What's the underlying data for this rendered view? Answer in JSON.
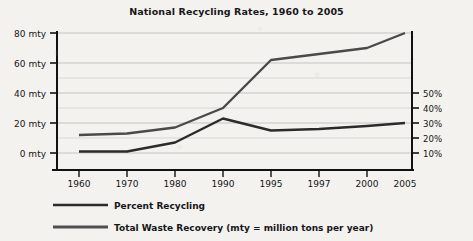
{
  "chart_data": {
    "type": "line",
    "title": "National Recycling Rates, 1960 to 2005",
    "xlabel": "",
    "ylabel": "",
    "grid": true,
    "legend_position": "bottom-left",
    "categories": [
      "1960",
      "1970",
      "1980",
      "1990",
      "1995",
      "1997",
      "2000",
      "2005"
    ],
    "left_axis": {
      "ticks": [
        "0 mty",
        "20 mty",
        "40 mty",
        "60 mty",
        "80 mty"
      ],
      "values": [
        0,
        20,
        40,
        60,
        80
      ],
      "unit": "mty",
      "ylim": [
        0,
        80
      ]
    },
    "right_axis": {
      "ticks": [
        "10%",
        "20%",
        "30%",
        "40%",
        "50%"
      ],
      "values": [
        10,
        20,
        30,
        40,
        50
      ],
      "unit": "%",
      "ylim": [
        0,
        100
      ]
    },
    "series": [
      {
        "name": "Percent Recycling",
        "axis": "right",
        "unit": "%",
        "values": [
          11,
          11,
          17,
          33,
          25,
          26,
          28,
          30
        ],
        "color": "#2b2b2b"
      },
      {
        "name": "Total Waste Recovery (mty = million tons per year)",
        "axis": "left",
        "unit": "mty",
        "values": [
          12,
          13,
          17,
          30,
          62,
          66,
          70,
          80
        ],
        "color": "#4a4a4a"
      }
    ]
  },
  "legend": {
    "items": [
      {
        "label": "Percent Recycling"
      },
      {
        "label": "Total Waste Recovery (mty = million tons per year)"
      }
    ]
  },
  "axes": {
    "left_ticks": [
      "80 mty",
      "60 mty",
      "40 mty",
      "20 mty",
      "0 mty"
    ],
    "right_ticks": [
      "50%",
      "40%",
      "30%",
      "20%",
      "10%"
    ],
    "x_ticks": [
      "1960",
      "1970",
      "1980",
      "1990",
      "1995",
      "1997",
      "2000",
      "2005"
    ]
  }
}
